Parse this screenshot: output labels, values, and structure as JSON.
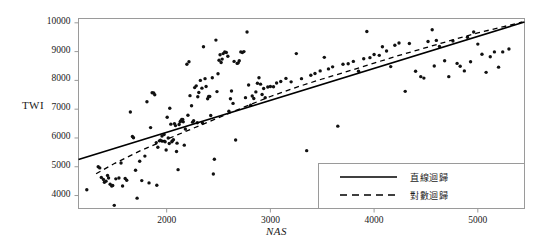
{
  "chart_data": {
    "type": "scatter",
    "title": "",
    "xlabel": "NAS",
    "ylabel": "TWI",
    "xlim": [
      1150,
      5450
    ],
    "ylim": [
      3550,
      10150
    ],
    "xticks": [
      2000,
      3000,
      4000,
      5000
    ],
    "yticks": [
      4000,
      5000,
      6000,
      7000,
      8000,
      9000,
      10000
    ],
    "xtick_labels": [
      "2000",
      "3000",
      "4000",
      "5000"
    ],
    "ytick_labels": [
      "4000",
      "5000",
      "6000",
      "7000",
      "8000",
      "9000",
      "10000"
    ],
    "grid": false,
    "legend_position": "bottom-right",
    "marker_color": "#111111",
    "line_color": "#000000",
    "frame_color": "#999999",
    "series": [
      {
        "name": "scatter-points",
        "type": "scatter",
        "points": [
          [
            1230,
            4200
          ],
          [
            1340,
            5000
          ],
          [
            1355,
            4960
          ],
          [
            1370,
            4630
          ],
          [
            1390,
            4560
          ],
          [
            1400,
            4460
          ],
          [
            1415,
            4500
          ],
          [
            1430,
            4700
          ],
          [
            1440,
            4610
          ],
          [
            1455,
            4390
          ],
          [
            1470,
            4330
          ],
          [
            1480,
            4350
          ],
          [
            1495,
            3660
          ],
          [
            1510,
            4580
          ],
          [
            1540,
            4610
          ],
          [
            1560,
            5130
          ],
          [
            1575,
            4330
          ],
          [
            1600,
            4590
          ],
          [
            1615,
            4530
          ],
          [
            1650,
            6900
          ],
          [
            1670,
            6050
          ],
          [
            1680,
            6010
          ],
          [
            1700,
            4880
          ],
          [
            1715,
            3910
          ],
          [
            1740,
            5190
          ],
          [
            1760,
            4520
          ],
          [
            1790,
            5370
          ],
          [
            1810,
            7260
          ],
          [
            1830,
            4440
          ],
          [
            1845,
            6360
          ],
          [
            1860,
            7570
          ],
          [
            1875,
            7560
          ],
          [
            1885,
            7500
          ],
          [
            1900,
            5840
          ],
          [
            1905,
            4360
          ],
          [
            1915,
            5680
          ],
          [
            1930,
            5900
          ],
          [
            1940,
            5920
          ],
          [
            1955,
            6070
          ],
          [
            1960,
            5890
          ],
          [
            1975,
            6120
          ],
          [
            1985,
            5870
          ],
          [
            1995,
            5580
          ],
          [
            2005,
            6720
          ],
          [
            2015,
            6000
          ],
          [
            2025,
            5810
          ],
          [
            2030,
            7030
          ],
          [
            2040,
            6480
          ],
          [
            2050,
            5870
          ],
          [
            2055,
            5900
          ],
          [
            2065,
            5940
          ],
          [
            2075,
            6500
          ],
          [
            2085,
            6430
          ],
          [
            2095,
            5530
          ],
          [
            2100,
            5820
          ],
          [
            2110,
            4900
          ],
          [
            2120,
            6470
          ],
          [
            2130,
            6560
          ],
          [
            2135,
            6590
          ],
          [
            2145,
            6640
          ],
          [
            2155,
            6640
          ],
          [
            2160,
            6560
          ],
          [
            2170,
            5750
          ],
          [
            2180,
            6310
          ],
          [
            2195,
            8560
          ],
          [
            2205,
            6790
          ],
          [
            2215,
            8650
          ],
          [
            2225,
            7470
          ],
          [
            2240,
            7120
          ],
          [
            2250,
            6550
          ],
          [
            2260,
            6600
          ],
          [
            2270,
            7750
          ],
          [
            2285,
            7810
          ],
          [
            2295,
            6530
          ],
          [
            2300,
            7430
          ],
          [
            2310,
            7580
          ],
          [
            2325,
            8000
          ],
          [
            2340,
            7730
          ],
          [
            2345,
            6520
          ],
          [
            2355,
            9170
          ],
          [
            2370,
            8060
          ],
          [
            2380,
            7790
          ],
          [
            2395,
            7360
          ],
          [
            2405,
            7440
          ],
          [
            2415,
            7440
          ],
          [
            2425,
            6780
          ],
          [
            2440,
            8090
          ],
          [
            2450,
            4750
          ],
          [
            2460,
            5260
          ],
          [
            2475,
            9400
          ],
          [
            2485,
            7610
          ],
          [
            2495,
            8230
          ],
          [
            2505,
            8700
          ],
          [
            2515,
            8890
          ],
          [
            2525,
            8620
          ],
          [
            2535,
            8740
          ],
          [
            2545,
            8930
          ],
          [
            2560,
            8990
          ],
          [
            2575,
            8970
          ],
          [
            2590,
            8840
          ],
          [
            2600,
            6930
          ],
          [
            2615,
            7360
          ],
          [
            2625,
            7630
          ],
          [
            2640,
            7200
          ],
          [
            2650,
            8660
          ],
          [
            2665,
            5930
          ],
          [
            2680,
            8590
          ],
          [
            2690,
            8610
          ],
          [
            2700,
            8680
          ],
          [
            2715,
            8990
          ],
          [
            2730,
            8970
          ],
          [
            2745,
            9000
          ],
          [
            2760,
            7400
          ],
          [
            2775,
            9680
          ],
          [
            2790,
            7840
          ],
          [
            2810,
            7140
          ],
          [
            2825,
            7460
          ],
          [
            2840,
            7370
          ],
          [
            2860,
            7600
          ],
          [
            2875,
            7900
          ],
          [
            2890,
            8090
          ],
          [
            2905,
            7870
          ],
          [
            2920,
            7510
          ],
          [
            2935,
            7720
          ],
          [
            2950,
            7400
          ],
          [
            2975,
            7770
          ],
          [
            3000,
            7790
          ],
          [
            3030,
            7780
          ],
          [
            3060,
            7910
          ],
          [
            3100,
            7960
          ],
          [
            3150,
            8070
          ],
          [
            3200,
            7950
          ],
          [
            3250,
            8930
          ],
          [
            3300,
            8060
          ],
          [
            3350,
            5560
          ],
          [
            3390,
            8180
          ],
          [
            3430,
            8240
          ],
          [
            3480,
            8330
          ],
          [
            3520,
            8800
          ],
          [
            3560,
            8400
          ],
          [
            3600,
            8470
          ],
          [
            3650,
            6410
          ],
          [
            3700,
            8560
          ],
          [
            3750,
            8580
          ],
          [
            3800,
            8660
          ],
          [
            3850,
            8320
          ],
          [
            3900,
            8750
          ],
          [
            3930,
            9700
          ],
          [
            3960,
            8790
          ],
          [
            4000,
            8900
          ],
          [
            4050,
            8870
          ],
          [
            4080,
            9170
          ],
          [
            4120,
            9020
          ],
          [
            4160,
            8480
          ],
          [
            4200,
            9220
          ],
          [
            4240,
            9300
          ],
          [
            4300,
            7620
          ],
          [
            4340,
            9280
          ],
          [
            4400,
            8320
          ],
          [
            4450,
            8130
          ],
          [
            4480,
            8080
          ],
          [
            4520,
            9350
          ],
          [
            4560,
            9760
          ],
          [
            4580,
            8500
          ],
          [
            4600,
            9390
          ],
          [
            4630,
            9180
          ],
          [
            4680,
            8680
          ],
          [
            4720,
            8130
          ],
          [
            4760,
            9370
          ],
          [
            4800,
            8590
          ],
          [
            4830,
            8490
          ],
          [
            4870,
            8330
          ],
          [
            4900,
            9500
          ],
          [
            4930,
            8650
          ],
          [
            4960,
            9680
          ],
          [
            5000,
            9260
          ],
          [
            5040,
            8910
          ],
          [
            5080,
            8280
          ],
          [
            5120,
            8820
          ],
          [
            5160,
            8990
          ],
          [
            5200,
            8460
          ],
          [
            5240,
            8990
          ],
          [
            5300,
            9090
          ]
        ]
      },
      {
        "name": "直線迴歸",
        "type": "line",
        "style": "solid",
        "endpoints": [
          [
            1150,
            5250
          ],
          [
            5450,
            10030
          ]
        ],
        "description": "linear regression line"
      },
      {
        "name": "對數迴歸",
        "type": "line",
        "style": "dashed",
        "description": "logarithmic regression curve",
        "points": [
          [
            1320,
            4760
          ],
          [
            1500,
            5120
          ],
          [
            1750,
            5560
          ],
          [
            2000,
            5950
          ],
          [
            2250,
            6330
          ],
          [
            2500,
            6700
          ],
          [
            2750,
            7080
          ],
          [
            3000,
            7440
          ],
          [
            3250,
            7760
          ],
          [
            3500,
            8050
          ],
          [
            3750,
            8320
          ],
          [
            4000,
            8600
          ],
          [
            4250,
            8880
          ],
          [
            4500,
            9140
          ],
          [
            4750,
            9400
          ],
          [
            5000,
            9650
          ],
          [
            5250,
            9870
          ],
          [
            5430,
            10030
          ]
        ]
      }
    ],
    "legend": [
      {
        "label": "直線迴歸",
        "style": "solid"
      },
      {
        "label": "對數迴歸",
        "style": "dashed"
      }
    ]
  }
}
